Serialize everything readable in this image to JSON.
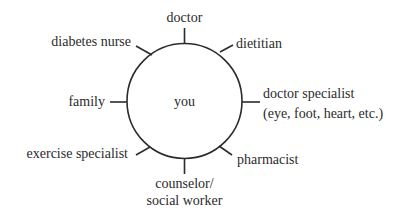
{
  "diagram": {
    "type": "hub-and-spoke",
    "center": {
      "label": "you"
    },
    "colors": {
      "stroke": "#2b2b2b",
      "text": "#2b2b2b",
      "background": "#ffffff"
    },
    "nodes": [
      {
        "id": "doctor",
        "lines": [
          "doctor"
        ],
        "position": "top"
      },
      {
        "id": "dietitian",
        "lines": [
          "dietitian"
        ],
        "position": "top-right"
      },
      {
        "id": "doctor-specialist",
        "lines": [
          "doctor specialist",
          "(eye, foot, heart, etc.)"
        ],
        "position": "right"
      },
      {
        "id": "pharmacist",
        "lines": [
          "pharmacist"
        ],
        "position": "bottom-right"
      },
      {
        "id": "counselor",
        "lines": [
          "counselor/",
          "social worker"
        ],
        "position": "bottom"
      },
      {
        "id": "exercise-specialist",
        "lines": [
          "exercise specialist"
        ],
        "position": "bottom-left"
      },
      {
        "id": "family",
        "lines": [
          "family"
        ],
        "position": "left"
      },
      {
        "id": "diabetes-nurse",
        "lines": [
          "diabetes nurse"
        ],
        "position": "top-left"
      }
    ]
  }
}
